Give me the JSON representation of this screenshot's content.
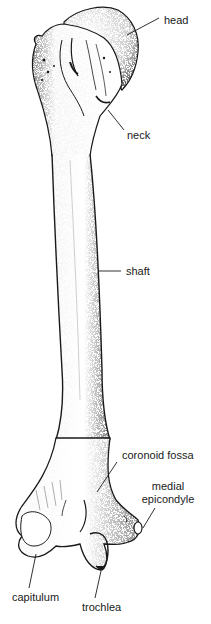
{
  "figure": {
    "labels": {
      "head": "head",
      "neck": "neck",
      "shaft": "shaft",
      "coronoid_fossa": "coronoid fossa",
      "medial_epicondyle_line1": "medial",
      "medial_epicondyle_line2": "epicondyle",
      "capitulum": "capitulum",
      "trochlea": "trochlea"
    },
    "colors": {
      "ink": "#1a1a1a",
      "background": "#ffffff"
    }
  }
}
